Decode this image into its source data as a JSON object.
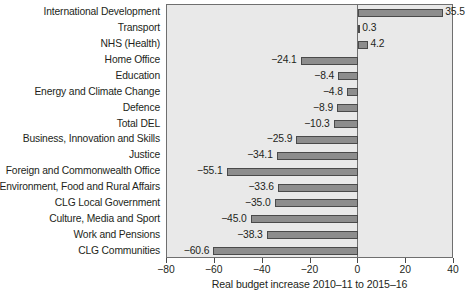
{
  "chart_data": {
    "type": "bar",
    "orientation": "horizontal",
    "title": "",
    "xlabel": "Real budget increase 2010–11 to 2015–16",
    "ylabel": "",
    "xlim": [
      -80,
      40
    ],
    "xticks": [
      -80,
      -60,
      -40,
      -20,
      0,
      20,
      40
    ],
    "xticklabels": [
      "−80",
      "−60",
      "−40",
      "−20",
      "0",
      "20",
      "40"
    ],
    "grid": false,
    "legend": null,
    "categories": [
      "International Development",
      "Transport",
      "NHS (Health)",
      "Home Office",
      "Education",
      "Energy and Climate Change",
      "Defence",
      "Total DEL",
      "Business, Innovation and Skills",
      "Justice",
      "Foreign and Commonwealth Office",
      "Environment, Food and Rural Affairs",
      "CLG Local Government",
      "Culture, Media and Sport",
      "Work and Pensions",
      "CLG Communities"
    ],
    "values": [
      35.5,
      0.3,
      4.2,
      -24.1,
      -8.4,
      -4.8,
      -8.9,
      -10.3,
      -25.9,
      -34.1,
      -55.1,
      -33.6,
      -35.0,
      -45.0,
      -38.3,
      -60.6
    ],
    "value_labels": [
      "35.5",
      "0.3",
      "4.2",
      "−24.1",
      "−8.4",
      "−4.8",
      "−8.9",
      "−10.3",
      "−25.9",
      "−34.1",
      "−55.1",
      "−33.6",
      "−35.0",
      "−45.0",
      "−38.3",
      "−60.6"
    ],
    "colors": {
      "bar_fill": "#8d8d8d",
      "bar_edge": "#4a4a4a",
      "plot_background": "#e9e9e9",
      "frame": "#6f6f6f",
      "text": "#231f20"
    }
  }
}
